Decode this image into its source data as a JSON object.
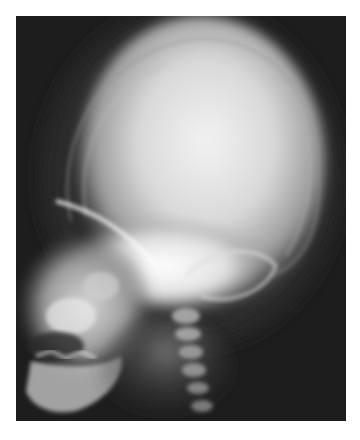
{
  "image": {
    "type": "radiograph",
    "subject": "lateral skull x-ray",
    "view": "lateral",
    "orientation": "face-left",
    "colors": {
      "border": "#ffffff",
      "background": "#1c1c1c",
      "bone_bright": "#f4f4f4",
      "soft_tissue": "#5a5a5a"
    },
    "regions": [
      "cranial-vault",
      "facial-bones",
      "mandible",
      "cervical-spine",
      "skull-outline"
    ]
  }
}
